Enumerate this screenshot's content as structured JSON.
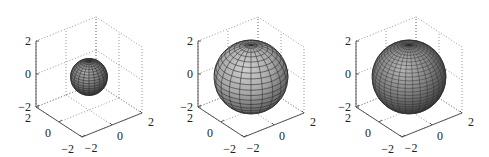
{
  "chart_data": [
    {
      "type": "surface",
      "subtype": "sphere",
      "title": "",
      "xlabel": "",
      "ylabel": "",
      "zlabel": "",
      "sphere_radius": 1,
      "mesh_segments": 20,
      "face_color": "#7a7a7a",
      "face_highlight": "#b4b4b4",
      "face_shadow": "#3c3c3c",
      "xlim": [
        -2,
        2
      ],
      "ylim": [
        -2,
        2
      ],
      "zlim": [
        -2,
        2
      ],
      "x_ticks": [
        "−2",
        "0",
        "2"
      ],
      "y_ticks": [
        "−2",
        "0",
        "2"
      ],
      "z_ticks": [
        "−2",
        "0",
        "2"
      ],
      "grid": true,
      "view": "3d-default"
    },
    {
      "type": "surface",
      "subtype": "sphere",
      "title": "",
      "xlabel": "",
      "ylabel": "",
      "zlabel": "",
      "sphere_radius": 2,
      "mesh_segments": 20,
      "face_color": "#a6a6a6",
      "face_highlight": "#d0d0d0",
      "face_shadow": "#5a5a5a",
      "xlim": [
        -2,
        2
      ],
      "ylim": [
        -2,
        2
      ],
      "zlim": [
        -2,
        2
      ],
      "x_ticks": [
        "−2",
        "0",
        "2"
      ],
      "y_ticks": [
        "−2",
        "0",
        "2"
      ],
      "z_ticks": [
        "−2",
        "0",
        "2"
      ],
      "grid": true,
      "view": "3d-default"
    },
    {
      "type": "surface",
      "subtype": "sphere",
      "title": "",
      "xlabel": "",
      "ylabel": "",
      "zlabel": "",
      "sphere_radius": 2,
      "mesh_segments": 30,
      "face_color": "#808080",
      "face_highlight": "#b8b8b8",
      "face_shadow": "#3e3e3e",
      "xlim": [
        -2,
        2
      ],
      "ylim": [
        -2,
        2
      ],
      "zlim": [
        -2,
        2
      ],
      "x_ticks": [
        "−2",
        "0",
        "2"
      ],
      "y_ticks": [
        "−2",
        "0",
        "2"
      ],
      "z_ticks": [
        "−2",
        "0",
        "2"
      ],
      "grid": true,
      "view": "3d-default"
    }
  ]
}
